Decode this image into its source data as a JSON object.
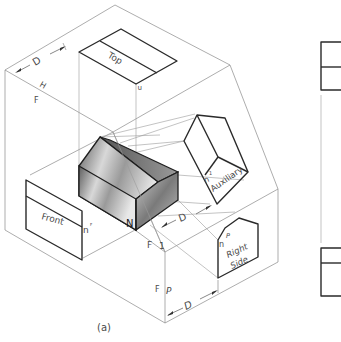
{
  "figure": {
    "caption": "(a)",
    "views": {
      "top": "Top",
      "front": "Front",
      "auxiliary": "Auxiliary",
      "right_side_line1": "Right",
      "right_side_line2": "Side"
    },
    "fold_labels": {
      "h": "H",
      "f_top": "F",
      "f_aux": "F",
      "one": "1",
      "f_side": "F",
      "p": "P"
    },
    "dimensions": {
      "d_top": "D",
      "d_aux": "D",
      "d_side": "D"
    },
    "point_labels": {
      "n_object": "N",
      "n_top": "n",
      "n_top_sub": "H",
      "n_front": "n",
      "n_front_sub": "F",
      "n_aux": "n",
      "n_aux_sub": "1",
      "n_side": "n",
      "n_side_sub": "P"
    },
    "colors": {
      "line": "#2a2a2a",
      "thin_line": "#8a8a8a",
      "shade_light": "#f2f2f2",
      "shade_dark": "#6a6a6a"
    }
  }
}
